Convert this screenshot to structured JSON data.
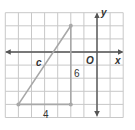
{
  "figure": {
    "type": "coordinate-plane-right-triangle",
    "grid": {
      "x_min": -7,
      "x_max": 2,
      "y_min": -5,
      "y_max": 3,
      "unit_px": 13.1,
      "origin_px": [
        97,
        52
      ],
      "line_color": "#c8c8c8",
      "border_color": "#bdbdbd"
    },
    "axes": {
      "color": "#555555",
      "x_label": "x",
      "y_label": "y",
      "origin_label": "O"
    },
    "triangle": {
      "vertices": [
        [
          -2,
          2
        ],
        [
          -6,
          -4
        ],
        [
          -2,
          -4
        ]
      ],
      "color": "#a8a8a8",
      "hypotenuse_label": "c",
      "vertical_leg_label": "6",
      "horizontal_leg_label": "4"
    }
  },
  "labels": {
    "x_axis": "x",
    "y_axis": "y",
    "origin": "O",
    "hypotenuse": "c",
    "vertical_leg": "6",
    "horizontal_leg": "4"
  }
}
